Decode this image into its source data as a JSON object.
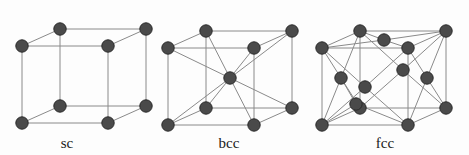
{
  "figure": {
    "name": "crystal-lattice-unit-cells",
    "background_color": "#fdfdfd",
    "atom_color": "#4a4a4a",
    "atom_edge_color": "#2b2b2b",
    "bond_color": "#8a8a8a",
    "label_color": "#1a1a1a",
    "atom_radius": 6.2,
    "bond_width": 1.0
  },
  "chart_data": {
    "type": "diagram",
    "title": "",
    "subtitle": "",
    "xlabel": "",
    "ylabel": "",
    "legend": [],
    "annotations": [],
    "cells": [
      {
        "id": "sc",
        "label": "sc",
        "full_name": "simple cubic",
        "label_x": 67,
        "label_y": 148,
        "atom_count": 8,
        "corner_atoms": 8,
        "body_center_atoms": 0,
        "face_center_atoms": 0,
        "geometry": {
          "front_bottom_left": [
            22,
            123
          ],
          "front_bottom_right": [
            108,
            123
          ],
          "front_top_left": [
            22,
            46
          ],
          "front_top_right": [
            108,
            46
          ],
          "back_bottom_left": [
            60,
            106
          ],
          "back_bottom_right": [
            146,
            106
          ],
          "back_top_left": [
            60,
            29
          ],
          "back_top_right": [
            146,
            29
          ]
        },
        "atoms": [
          {
            "name": "corner-front-bottom-left",
            "x": 22,
            "y": 123
          },
          {
            "name": "corner-front-bottom-right",
            "x": 108,
            "y": 123
          },
          {
            "name": "corner-front-top-left",
            "x": 22,
            "y": 46
          },
          {
            "name": "corner-front-top-right",
            "x": 108,
            "y": 46
          },
          {
            "name": "corner-back-bottom-left",
            "x": 60,
            "y": 106
          },
          {
            "name": "corner-back-bottom-right",
            "x": 146,
            "y": 106
          },
          {
            "name": "corner-back-top-left",
            "x": 60,
            "y": 29
          },
          {
            "name": "corner-back-top-right",
            "x": 146,
            "y": 29
          }
        ],
        "bonds": [
          [
            22,
            123,
            108,
            123
          ],
          [
            22,
            123,
            22,
            46
          ],
          [
            108,
            123,
            108,
            46
          ],
          [
            22,
            46,
            108,
            46
          ],
          [
            60,
            106,
            146,
            106
          ],
          [
            60,
            106,
            60,
            29
          ],
          [
            146,
            106,
            146,
            29
          ],
          [
            60,
            29,
            146,
            29
          ],
          [
            22,
            123,
            60,
            106
          ],
          [
            108,
            123,
            146,
            106
          ],
          [
            22,
            46,
            60,
            29
          ],
          [
            108,
            46,
            146,
            29
          ]
        ]
      },
      {
        "id": "bcc",
        "label": "bcc",
        "full_name": "body-centred cubic",
        "label_x": 229,
        "label_y": 148,
        "atom_count": 9,
        "corner_atoms": 8,
        "body_center_atoms": 1,
        "face_center_atoms": 0,
        "geometry": {
          "front_bottom_left": [
            168,
            125
          ],
          "front_bottom_right": [
            254,
            125
          ],
          "front_top_left": [
            168,
            48
          ],
          "front_top_right": [
            254,
            48
          ],
          "back_bottom_left": [
            206,
            108
          ],
          "back_bottom_right": [
            292,
            108
          ],
          "back_top_left": [
            206,
            31
          ],
          "back_top_right": [
            292,
            31
          ],
          "body_center": [
            230,
            78
          ]
        },
        "atoms": [
          {
            "name": "corner-front-bottom-left",
            "x": 168,
            "y": 125
          },
          {
            "name": "corner-front-bottom-right",
            "x": 254,
            "y": 125
          },
          {
            "name": "corner-front-top-left",
            "x": 168,
            "y": 48
          },
          {
            "name": "corner-front-top-right",
            "x": 254,
            "y": 48
          },
          {
            "name": "corner-back-bottom-left",
            "x": 206,
            "y": 108
          },
          {
            "name": "corner-back-bottom-right",
            "x": 292,
            "y": 108
          },
          {
            "name": "corner-back-top-left",
            "x": 206,
            "y": 31
          },
          {
            "name": "corner-back-top-right",
            "x": 292,
            "y": 31
          },
          {
            "name": "body-center-atom",
            "x": 230,
            "y": 78
          }
        ],
        "bonds": [
          [
            168,
            125,
            254,
            125
          ],
          [
            168,
            125,
            168,
            48
          ],
          [
            254,
            125,
            254,
            48
          ],
          [
            168,
            48,
            254,
            48
          ],
          [
            206,
            108,
            292,
            108
          ],
          [
            206,
            108,
            206,
            31
          ],
          [
            292,
            108,
            292,
            31
          ],
          [
            206,
            31,
            292,
            31
          ],
          [
            168,
            125,
            206,
            108
          ],
          [
            254,
            125,
            292,
            108
          ],
          [
            168,
            48,
            206,
            31
          ],
          [
            254,
            48,
            292,
            31
          ],
          [
            230,
            78,
            168,
            125
          ],
          [
            230,
            78,
            254,
            125
          ],
          [
            230,
            78,
            168,
            48
          ],
          [
            230,
            78,
            254,
            48
          ],
          [
            230,
            78,
            206,
            108
          ],
          [
            230,
            78,
            292,
            108
          ],
          [
            230,
            78,
            206,
            31
          ],
          [
            230,
            78,
            292,
            31
          ]
        ]
      },
      {
        "id": "fcc",
        "label": "fcc",
        "full_name": "face-centred cubic",
        "label_x": 385,
        "label_y": 148,
        "atom_count": 14,
        "corner_atoms": 8,
        "body_center_atoms": 0,
        "face_center_atoms": 6,
        "geometry": {
          "front_bottom_left": [
            322,
            125
          ],
          "front_bottom_right": [
            408,
            125
          ],
          "front_top_left": [
            322,
            48
          ],
          "front_top_right": [
            408,
            48
          ],
          "back_bottom_left": [
            360,
            108
          ],
          "back_bottom_right": [
            446,
            108
          ],
          "back_top_left": [
            360,
            31
          ],
          "back_top_right": [
            446,
            31
          ],
          "face_top": [
            384,
            40
          ],
          "face_bottom": [
            384,
            117
          ],
          "face_front": [
            365,
            87
          ],
          "face_back": [
            403,
            70
          ],
          "face_left": [
            341,
            78
          ],
          "face_right": [
            427,
            78
          ]
        },
        "atoms": [
          {
            "name": "corner-front-bottom-left",
            "x": 322,
            "y": 125
          },
          {
            "name": "corner-front-bottom-right",
            "x": 408,
            "y": 125
          },
          {
            "name": "corner-front-top-left",
            "x": 322,
            "y": 48
          },
          {
            "name": "corner-front-top-right",
            "x": 408,
            "y": 48
          },
          {
            "name": "corner-back-bottom-left",
            "x": 360,
            "y": 108
          },
          {
            "name": "corner-back-bottom-right",
            "x": 446,
            "y": 108
          },
          {
            "name": "corner-back-top-left",
            "x": 360,
            "y": 31
          },
          {
            "name": "corner-back-top-right",
            "x": 446,
            "y": 31
          },
          {
            "name": "face-center-top",
            "x": 384,
            "y": 40
          },
          {
            "name": "face-center-front",
            "x": 365,
            "y": 87
          },
          {
            "name": "face-center-back",
            "x": 403,
            "y": 70
          },
          {
            "name": "face-center-right",
            "x": 427,
            "y": 78
          },
          {
            "name": "face-center-lower-front",
            "x": 356,
            "y": 104
          },
          {
            "name": "face-center-left",
            "x": 341,
            "y": 78
          }
        ],
        "bonds": [
          [
            322,
            125,
            408,
            125
          ],
          [
            322,
            125,
            322,
            48
          ],
          [
            408,
            125,
            408,
            48
          ],
          [
            322,
            48,
            408,
            48
          ],
          [
            360,
            108,
            446,
            108
          ],
          [
            360,
            108,
            360,
            31
          ],
          [
            446,
            108,
            446,
            31
          ],
          [
            360,
            31,
            446,
            31
          ],
          [
            322,
            125,
            360,
            108
          ],
          [
            408,
            125,
            446,
            108
          ],
          [
            322,
            48,
            360,
            31
          ],
          [
            408,
            48,
            446,
            31
          ],
          [
            384,
            40,
            322,
            48
          ],
          [
            384,
            40,
            408,
            48
          ],
          [
            384,
            40,
            360,
            31
          ],
          [
            384,
            40,
            446,
            31
          ],
          [
            365,
            87,
            322,
            125
          ],
          [
            365,
            87,
            322,
            48
          ],
          [
            365,
            87,
            408,
            125
          ],
          [
            365,
            87,
            408,
            48
          ],
          [
            403,
            70,
            360,
            108
          ],
          [
            403,
            70,
            360,
            31
          ],
          [
            403,
            70,
            446,
            108
          ],
          [
            403,
            70,
            446,
            31
          ],
          [
            427,
            78,
            408,
            125
          ],
          [
            427,
            78,
            408,
            48
          ],
          [
            427,
            78,
            446,
            108
          ],
          [
            427,
            78,
            446,
            31
          ],
          [
            341,
            78,
            322,
            125
          ],
          [
            341,
            78,
            322,
            48
          ],
          [
            341,
            78,
            360,
            108
          ],
          [
            341,
            78,
            360,
            31
          ],
          [
            356,
            104,
            322,
            125
          ],
          [
            356,
            104,
            408,
            125
          ],
          [
            356,
            104,
            360,
            108
          ],
          [
            356,
            104,
            341,
            78
          ]
        ]
      }
    ]
  }
}
